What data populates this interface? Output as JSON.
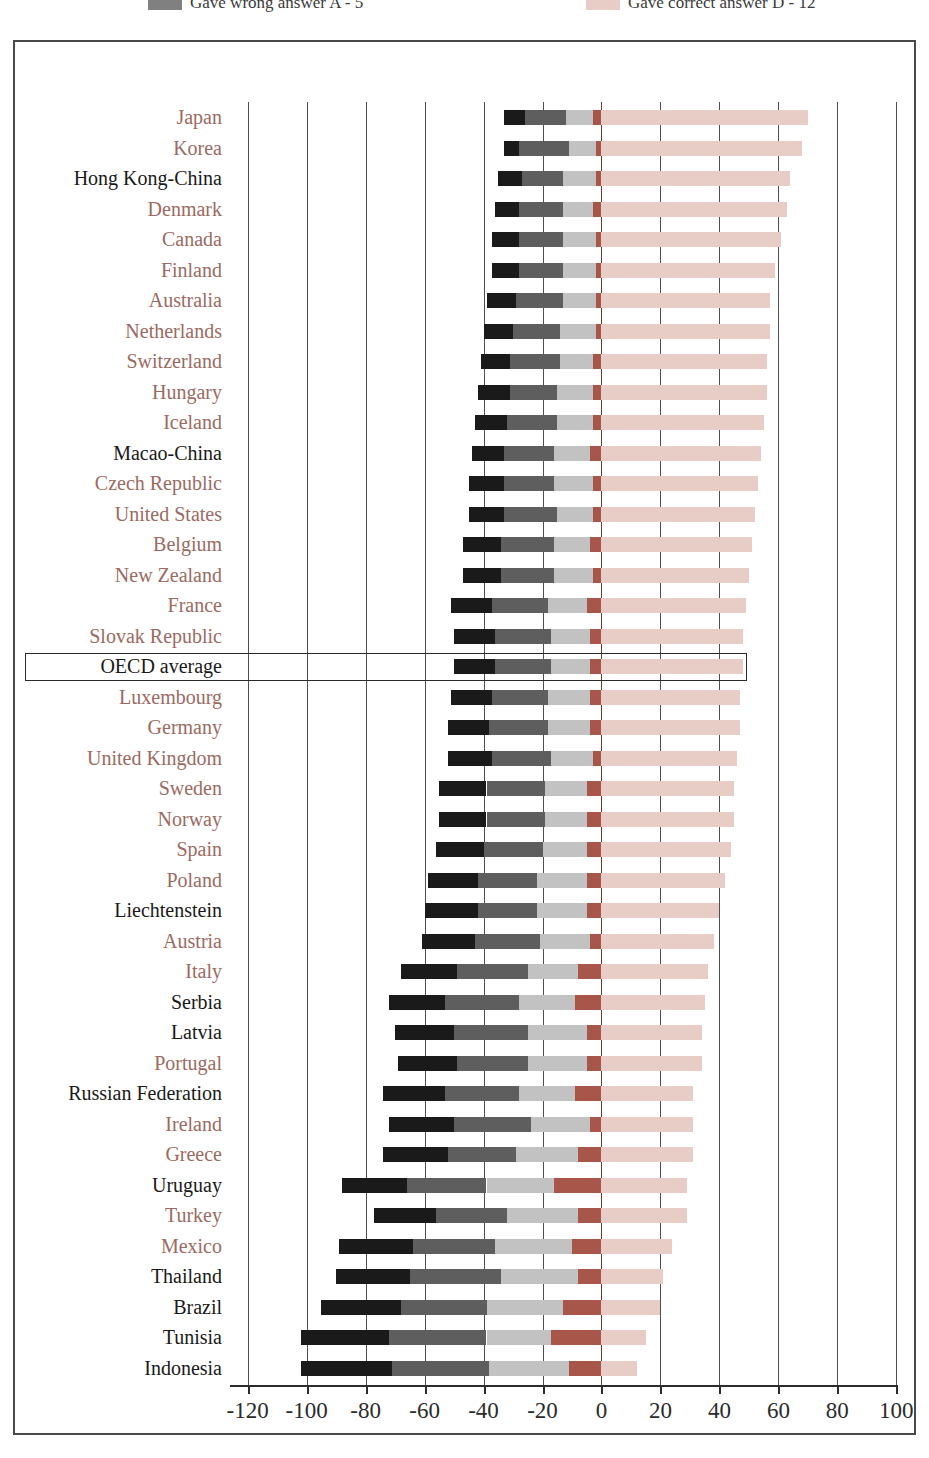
{
  "legend": {
    "items": [
      {
        "label": "Gave wrong answer A - 5",
        "color": "#808080",
        "name": "legend-wrong-answer"
      },
      {
        "label": "Gave correct answer D - 12",
        "color": "#e8cdc6",
        "name": "legend-correct-answer"
      }
    ]
  },
  "colors": {
    "black": "#1a1a1a",
    "dark_gray": "#5e5e5e",
    "light_gray": "#c2c2c2",
    "brick": "#a8564a",
    "pink": "#e8cdc6",
    "grid": "#4f4f4f",
    "zero_line": "#6b3a32",
    "oecd_label": "#9c6a62",
    "partner_label": "#1a1a1a",
    "frame": "#4a4a4a"
  },
  "axis": {
    "ticks": [
      -120,
      -100,
      -80,
      -60,
      -40,
      -20,
      0,
      20,
      40,
      60,
      80,
      100
    ],
    "min": -126,
    "max": 106,
    "grid": true
  },
  "highlight_row": "OECD average",
  "chart_data": {
    "type": "bar",
    "orientation": "horizontal",
    "stacked": true,
    "title": "",
    "xlabel": "",
    "ylabel": "",
    "xlim": [
      -126,
      106
    ],
    "grid": true,
    "legend_position": "top",
    "series": [
      {
        "name": "Gave wrong answer A - 5",
        "key": "wrong_a",
        "color": "#1a1a1a",
        "side": "negative"
      },
      {
        "name": "Gave wrong answer B",
        "key": "wrong_b",
        "color": "#5e5e5e",
        "side": "negative"
      },
      {
        "name": "Gave wrong answer C",
        "key": "wrong_c",
        "color": "#c2c2c2",
        "side": "negative"
      },
      {
        "name": "Missing / no answer",
        "key": "missing",
        "color": "#a8564a",
        "side": "negative"
      },
      {
        "name": "Gave correct answer D - 12",
        "key": "correct",
        "color": "#e8cdc6",
        "side": "positive"
      }
    ],
    "categories": [
      "Japan",
      "Korea",
      "Hong Kong-China",
      "Denmark",
      "Canada",
      "Finland",
      "Australia",
      "Netherlands",
      "Switzerland",
      "Hungary",
      "Iceland",
      "Macao-China",
      "Czech Republic",
      "United States",
      "Belgium",
      "New Zealand",
      "France",
      "Slovak Republic",
      "OECD average",
      "Luxembourg",
      "Germany",
      "United Kingdom",
      "Sweden",
      "Norway",
      "Spain",
      "Poland",
      "Liechtenstein",
      "Austria",
      "Italy",
      "Serbia",
      "Latvia",
      "Portugal",
      "Russian Federation",
      "Ireland",
      "Greece",
      "Uruguay",
      "Turkey",
      "Mexico",
      "Thailand",
      "Brazil",
      "Tunisia",
      "Indonesia"
    ],
    "rows": [
      {
        "country": "Japan",
        "group": "oecd",
        "wrong_a": 7,
        "wrong_b": 14,
        "wrong_c": 9,
        "missing": 3,
        "correct": 70
      },
      {
        "country": "Korea",
        "group": "oecd",
        "wrong_a": 5,
        "wrong_b": 17,
        "wrong_c": 9,
        "missing": 2,
        "correct": 68
      },
      {
        "country": "Hong Kong-China",
        "group": "partner",
        "wrong_a": 8,
        "wrong_b": 14,
        "wrong_c": 11,
        "missing": 2,
        "correct": 64
      },
      {
        "country": "Denmark",
        "group": "oecd",
        "wrong_a": 8,
        "wrong_b": 15,
        "wrong_c": 10,
        "missing": 3,
        "correct": 63
      },
      {
        "country": "Canada",
        "group": "oecd",
        "wrong_a": 9,
        "wrong_b": 15,
        "wrong_c": 11,
        "missing": 2,
        "correct": 61
      },
      {
        "country": "Finland",
        "group": "oecd",
        "wrong_a": 9,
        "wrong_b": 15,
        "wrong_c": 11,
        "missing": 2,
        "correct": 59
      },
      {
        "country": "Australia",
        "group": "oecd",
        "wrong_a": 10,
        "wrong_b": 16,
        "wrong_c": 11,
        "missing": 2,
        "correct": 57
      },
      {
        "country": "Netherlands",
        "group": "oecd",
        "wrong_a": 10,
        "wrong_b": 16,
        "wrong_c": 12,
        "missing": 2,
        "correct": 57
      },
      {
        "country": "Switzerland",
        "group": "oecd",
        "wrong_a": 10,
        "wrong_b": 17,
        "wrong_c": 11,
        "missing": 3,
        "correct": 56
      },
      {
        "country": "Hungary",
        "group": "oecd",
        "wrong_a": 11,
        "wrong_b": 16,
        "wrong_c": 12,
        "missing": 3,
        "correct": 56
      },
      {
        "country": "Iceland",
        "group": "oecd",
        "wrong_a": 11,
        "wrong_b": 17,
        "wrong_c": 12,
        "missing": 3,
        "correct": 55
      },
      {
        "country": "Macao-China",
        "group": "partner",
        "wrong_a": 11,
        "wrong_b": 17,
        "wrong_c": 12,
        "missing": 4,
        "correct": 54
      },
      {
        "country": "Czech Republic",
        "group": "oecd",
        "wrong_a": 12,
        "wrong_b": 17,
        "wrong_c": 13,
        "missing": 3,
        "correct": 53
      },
      {
        "country": "United States",
        "group": "oecd",
        "wrong_a": 12,
        "wrong_b": 18,
        "wrong_c": 12,
        "missing": 3,
        "correct": 52
      },
      {
        "country": "Belgium",
        "group": "oecd",
        "wrong_a": 13,
        "wrong_b": 18,
        "wrong_c": 12,
        "missing": 4,
        "correct": 51
      },
      {
        "country": "New Zealand",
        "group": "oecd",
        "wrong_a": 13,
        "wrong_b": 18,
        "wrong_c": 13,
        "missing": 3,
        "correct": 50
      },
      {
        "country": "France",
        "group": "oecd",
        "wrong_a": 14,
        "wrong_b": 19,
        "wrong_c": 13,
        "missing": 5,
        "correct": 49
      },
      {
        "country": "Slovak Republic",
        "group": "oecd",
        "wrong_a": 14,
        "wrong_b": 19,
        "wrong_c": 13,
        "missing": 4,
        "correct": 48
      },
      {
        "country": "OECD average",
        "group": "average",
        "wrong_a": 14,
        "wrong_b": 19,
        "wrong_c": 13,
        "missing": 4,
        "correct": 48
      },
      {
        "country": "Luxembourg",
        "group": "oecd",
        "wrong_a": 14,
        "wrong_b": 19,
        "wrong_c": 14,
        "missing": 4,
        "correct": 47
      },
      {
        "country": "Germany",
        "group": "oecd",
        "wrong_a": 14,
        "wrong_b": 20,
        "wrong_c": 14,
        "missing": 4,
        "correct": 47
      },
      {
        "country": "United Kingdom",
        "group": "oecd",
        "wrong_a": 15,
        "wrong_b": 20,
        "wrong_c": 14,
        "missing": 3,
        "correct": 46
      },
      {
        "country": "Sweden",
        "group": "oecd",
        "wrong_a": 16,
        "wrong_b": 20,
        "wrong_c": 14,
        "missing": 5,
        "correct": 45
      },
      {
        "country": "Norway",
        "group": "oecd",
        "wrong_a": 16,
        "wrong_b": 20,
        "wrong_c": 14,
        "missing": 5,
        "correct": 45
      },
      {
        "country": "Spain",
        "group": "oecd",
        "wrong_a": 16,
        "wrong_b": 20,
        "wrong_c": 15,
        "missing": 5,
        "correct": 44
      },
      {
        "country": "Poland",
        "group": "oecd",
        "wrong_a": 17,
        "wrong_b": 20,
        "wrong_c": 17,
        "missing": 5,
        "correct": 42
      },
      {
        "country": "Liechtenstein",
        "group": "partner",
        "wrong_a": 18,
        "wrong_b": 20,
        "wrong_c": 17,
        "missing": 5,
        "correct": 40
      },
      {
        "country": "Austria",
        "group": "oecd",
        "wrong_a": 18,
        "wrong_b": 22,
        "wrong_c": 17,
        "missing": 4,
        "correct": 38
      },
      {
        "country": "Italy",
        "group": "oecd",
        "wrong_a": 19,
        "wrong_b": 24,
        "wrong_c": 17,
        "missing": 8,
        "correct": 36
      },
      {
        "country": "Serbia",
        "group": "partner",
        "wrong_a": 19,
        "wrong_b": 25,
        "wrong_c": 19,
        "missing": 9,
        "correct": 35
      },
      {
        "country": "Latvia",
        "group": "partner",
        "wrong_a": 20,
        "wrong_b": 25,
        "wrong_c": 20,
        "missing": 5,
        "correct": 34
      },
      {
        "country": "Portugal",
        "group": "oecd",
        "wrong_a": 20,
        "wrong_b": 24,
        "wrong_c": 20,
        "missing": 5,
        "correct": 34
      },
      {
        "country": "Russian Federation",
        "group": "partner",
        "wrong_a": 21,
        "wrong_b": 25,
        "wrong_c": 19,
        "missing": 9,
        "correct": 31
      },
      {
        "country": "Ireland",
        "group": "oecd",
        "wrong_a": 22,
        "wrong_b": 26,
        "wrong_c": 20,
        "missing": 4,
        "correct": 31
      },
      {
        "country": "Greece",
        "group": "oecd",
        "wrong_a": 22,
        "wrong_b": 23,
        "wrong_c": 21,
        "missing": 8,
        "correct": 31
      },
      {
        "country": "Uruguay",
        "group": "partner",
        "wrong_a": 22,
        "wrong_b": 27,
        "wrong_c": 23,
        "missing": 16,
        "correct": 29
      },
      {
        "country": "Turkey",
        "group": "oecd",
        "wrong_a": 21,
        "wrong_b": 24,
        "wrong_c": 24,
        "missing": 8,
        "correct": 29
      },
      {
        "country": "Mexico",
        "group": "oecd",
        "wrong_a": 25,
        "wrong_b": 28,
        "wrong_c": 26,
        "missing": 10,
        "correct": 24
      },
      {
        "country": "Thailand",
        "group": "partner",
        "wrong_a": 25,
        "wrong_b": 31,
        "wrong_c": 26,
        "missing": 8,
        "correct": 21
      },
      {
        "country": "Brazil",
        "group": "partner",
        "wrong_a": 27,
        "wrong_b": 29,
        "wrong_c": 26,
        "missing": 13,
        "correct": 20
      },
      {
        "country": "Tunisia",
        "group": "partner",
        "wrong_a": 30,
        "wrong_b": 33,
        "wrong_c": 22,
        "missing": 17,
        "correct": 15
      },
      {
        "country": "Indonesia",
        "group": "partner",
        "wrong_a": 31,
        "wrong_b": 33,
        "wrong_c": 27,
        "missing": 11,
        "correct": 12
      }
    ]
  }
}
